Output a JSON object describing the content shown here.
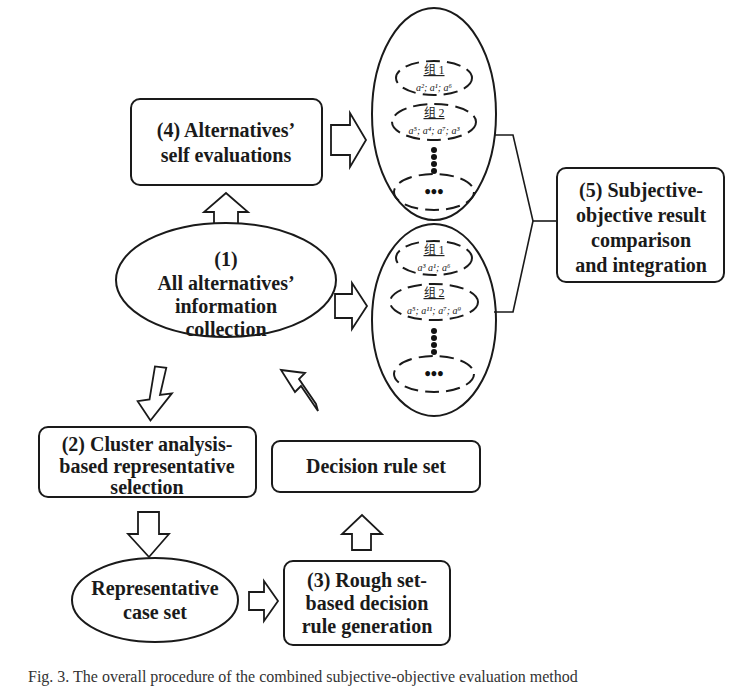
{
  "nodes": {
    "step1": {
      "lines": [
        "(1)",
        "All alternatives’",
        "information",
        "collection"
      ]
    },
    "step2": {
      "lines": [
        "(2) Cluster analysis-",
        "based representative",
        "selection"
      ]
    },
    "step3": {
      "lines": [
        "(3) Rough set-",
        "based decision",
        "rule generation"
      ]
    },
    "step4": {
      "lines": [
        "(4) Alternatives’",
        "self evaluations"
      ]
    },
    "step5": {
      "lines": [
        "(5) Subjective-",
        "objective result",
        "comparison",
        "and integration"
      ]
    },
    "representative_case_set": {
      "lines": [
        "Representative",
        "case set"
      ]
    },
    "decision_rule_set": {
      "lines": [
        "Decision rule set"
      ]
    }
  },
  "cluster_panels": {
    "subjective": {
      "groups": [
        {
          "label": "组 1",
          "members": "a²; a¹; a⁶"
        },
        {
          "label": "组 2",
          "members": "a⁵; a⁴; a⁷; a³"
        }
      ],
      "more_groups": "•••"
    },
    "objective": {
      "groups": [
        {
          "label": "组 1",
          "members": "a³ a¹; a⁶"
        },
        {
          "label": "组 2",
          "members": "a⁵; a¹¹; a⁷; a⁹"
        }
      ],
      "more_groups": "•••"
    }
  },
  "caption": "Fig. 3.  The overall procedure of the combined subjective-objective evaluation method"
}
